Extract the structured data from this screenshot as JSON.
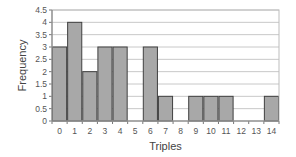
{
  "chart_data": {
    "type": "bar",
    "title": "",
    "xlabel": "Triples",
    "ylabel": "Frequency",
    "categories": [
      "0",
      "1",
      "2",
      "3",
      "4",
      "5",
      "6",
      "7",
      "8",
      "9",
      "10",
      "11",
      "12",
      "13",
      "14"
    ],
    "values": [
      3,
      4,
      2,
      3,
      3,
      0,
      3,
      1,
      0,
      1,
      1,
      1,
      0,
      0,
      1
    ],
    "ylim": [
      0,
      4.5
    ],
    "yticks": [
      "0",
      "0.5",
      "1",
      "1.5",
      "2",
      "2.5",
      "3",
      "3.5",
      "4",
      "4.5"
    ],
    "grid": true,
    "legend": null,
    "colors": {
      "bar_fill": "#a8a8a8",
      "bar_edge": "#404040",
      "grid": "#c8c8c8",
      "axis": "#777777"
    }
  }
}
